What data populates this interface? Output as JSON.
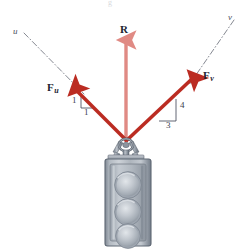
{
  "figure": {
    "background_color": "#ffffff"
  },
  "colors": {
    "resultant_vector": "#e08a84",
    "component_vector": "#bb2c22",
    "axis_line": "#5a5f6b",
    "label_text": "#1d2330",
    "body_metal_light": "#c8ccd2",
    "body_metal_mid": "#9aa1ab",
    "body_metal_dark": "#6e7682",
    "lens_fill": "#b7bec6"
  },
  "labels": {
    "resultant": "R",
    "force_u": "F",
    "force_u_sub": "u",
    "force_v": "F",
    "force_v_sub": "v",
    "axis_u": "u",
    "axis_v": "v",
    "top_cutoff": "g"
  },
  "slope_triangles": {
    "left": {
      "name": "u-component-slope",
      "rise": "1",
      "run": "1",
      "ratio": "1:1"
    },
    "right": {
      "name": "v-component-slope",
      "rise": "4",
      "run": "3",
      "ratio": "3:4"
    }
  },
  "vectors": [
    {
      "name": "resultant",
      "label": "R",
      "direction": "vertical-up",
      "color": "#e08a84",
      "origin_px": [
        126,
        141
      ],
      "tip_px": [
        126,
        36
      ]
    },
    {
      "name": "force-u",
      "label": "Fu",
      "direction": "up-left",
      "color": "#bb2c22",
      "origin_px": [
        126,
        141
      ],
      "tip_px": [
        72,
        86
      ]
    },
    {
      "name": "force-v",
      "label": "Fv",
      "direction": "up-right",
      "color": "#bb2c22",
      "origin_px": [
        126,
        141
      ],
      "tip_px": [
        197,
        74
      ]
    }
  ],
  "axes": [
    {
      "name": "axis-u",
      "label": "u",
      "style": "dash-dot",
      "from_px": [
        24,
        33
      ],
      "to_px": [
        82,
        92
      ]
    },
    {
      "name": "axis-v",
      "label": "v",
      "style": "dash-dot",
      "from_px": [
        232,
        22
      ],
      "to_px": [
        190,
        83
      ]
    }
  ],
  "traffic_light": {
    "name": "traffic-light-body",
    "lens_count": 3,
    "lenses": [
      "top-lens",
      "middle-lens",
      "bottom-lens"
    ],
    "mount": "eyebolt-ring-hook",
    "body_px": {
      "x": 105,
      "y": 158,
      "width": 46,
      "height": 88
    }
  }
}
